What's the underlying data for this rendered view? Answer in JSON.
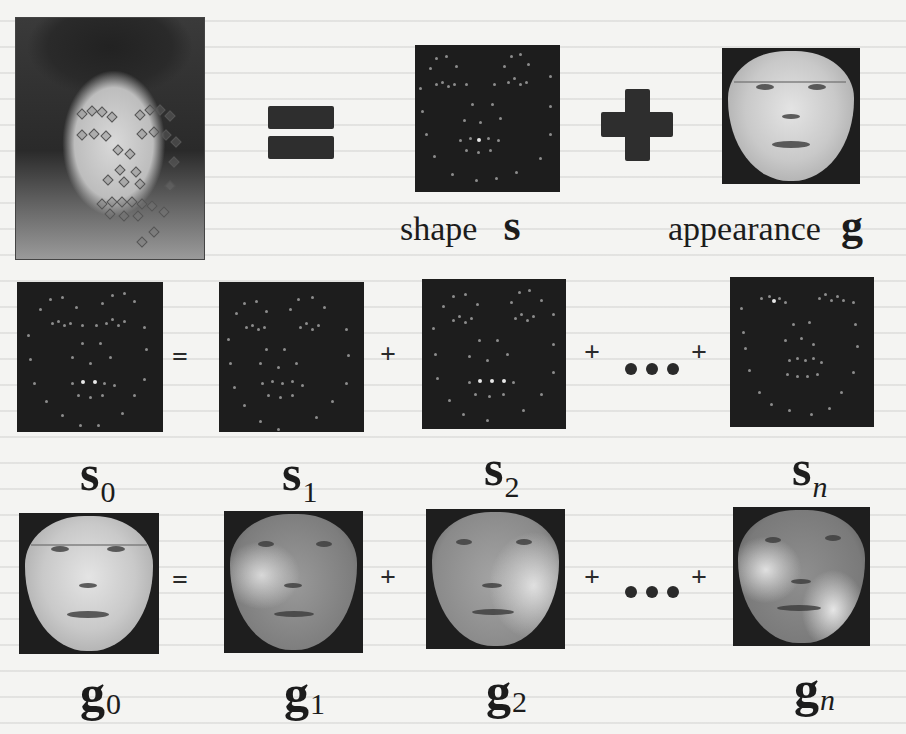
{
  "figure": {
    "top_row": {
      "input_photo": {
        "description": "face photo with landmark points overlaid"
      },
      "equals_symbol": "=",
      "plus_symbol": "+",
      "shape": {
        "word": "shape",
        "symbol": "s"
      },
      "appearance": {
        "word": "appearance",
        "symbol": "g"
      }
    },
    "shape_row": {
      "equals": "=",
      "plus": "+",
      "ellipsis": "...",
      "terms": [
        {
          "symbol": "s",
          "subscript": "0",
          "italic_sub": false
        },
        {
          "symbol": "s",
          "subscript": "1",
          "italic_sub": false
        },
        {
          "symbol": "s",
          "subscript": "2",
          "italic_sub": false
        },
        {
          "symbol": "s",
          "subscript": "n",
          "italic_sub": true
        }
      ]
    },
    "appearance_row": {
      "equals": "=",
      "plus": "+",
      "ellipsis": "...",
      "terms": [
        {
          "symbol": "g",
          "subscript": "0",
          "italic_sub": false
        },
        {
          "symbol": "g",
          "subscript": "1",
          "italic_sub": false
        },
        {
          "symbol": "g",
          "subscript": "2",
          "italic_sub": false
        },
        {
          "symbol": "g",
          "subscript": "n",
          "italic_sub": true
        }
      ]
    }
  },
  "colors": {
    "page_background": "#f4f4f2",
    "shape_box_background": "#1d1d1d",
    "landmark_dot": "#8c8c8c",
    "operator": "#2e2e2e"
  }
}
